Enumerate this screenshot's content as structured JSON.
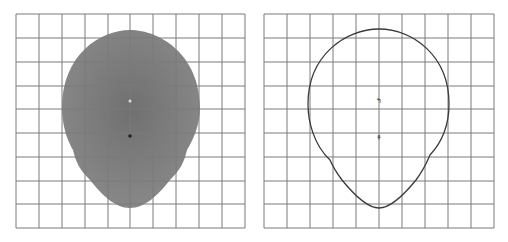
{
  "figure": {
    "panels": [
      {
        "id": "filled",
        "style": "filled-gray",
        "grid": {
          "cols": 10,
          "rows": 9
        }
      },
      {
        "id": "outline",
        "style": "outline",
        "grid": {
          "cols": 10,
          "rows": 9
        }
      }
    ],
    "colors": {
      "grid": "#7a7a7a",
      "fill": "#7d7d7d",
      "outline": "#3a3a3a",
      "background": "#ffffff"
    }
  }
}
